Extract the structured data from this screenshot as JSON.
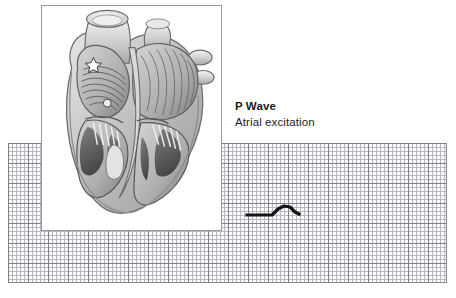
{
  "figure": {
    "background_color": "#ffffff",
    "width": 456,
    "height": 298
  },
  "caption": {
    "title": "P Wave",
    "subtitle": "Atrial excitation",
    "title_color": "#18181a",
    "subtitle_color": "#1d1d1f"
  },
  "illustration": {
    "name": "heart-cross-section",
    "alt": "Grayscale anatomical cross-section of the human heart showing the atria, ventricles, valves and great vessels, with the atrial walls highlighted to indicate the spread of excitation",
    "panel_background": "#ffffff",
    "panel_border_color": "#9a9a9a"
  },
  "ecg_grid": {
    "fine_line_color": "#b9b9c2",
    "bold_line_color": "#808088",
    "fine_cell_px": 4,
    "bold_cell_px": 20,
    "paper_color": "#fdfdfd"
  },
  "chart_data": {
    "type": "line",
    "title": "P Wave",
    "subtitle": "Atrial excitation",
    "xlabel": "Time",
    "ylabel": "Voltage",
    "grid": true,
    "legend_position": "none",
    "trace_color": "#141414",
    "trace_width_px": 3.2,
    "xlim": [
      240,
      305
    ],
    "ylim": [
      200,
      222
    ],
    "series": [
      {
        "name": "ECG P wave segment",
        "points": [
          [
            247,
            215
          ],
          [
            272,
            215
          ],
          [
            278,
            209
          ],
          [
            284,
            206
          ],
          [
            290,
            207
          ],
          [
            295,
            212
          ],
          [
            299,
            214
          ]
        ]
      }
    ],
    "annotations": [
      {
        "label": "P Wave",
        "description": "Atrial excitation",
        "x": 235,
        "y": 99
      }
    ]
  }
}
